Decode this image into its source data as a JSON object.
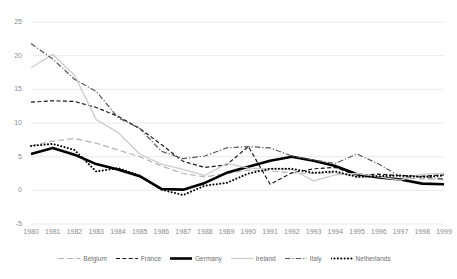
{
  "chart_data": {
    "type": "line",
    "title": "",
    "xlabel": "",
    "ylabel": "",
    "grid": true,
    "legend_position": "bottom",
    "xlim": [
      1980,
      1999
    ],
    "ylim": [
      -5,
      25
    ],
    "yticks": [
      -5,
      0,
      5,
      10,
      15,
      20,
      25
    ],
    "ytick_labels": [
      "-5",
      "0",
      "5",
      "10",
      "15",
      "20",
      "25"
    ],
    "x": [
      1980,
      1981,
      1982,
      1983,
      1984,
      1985,
      1986,
      1987,
      1988,
      1989,
      1990,
      1991,
      1992,
      1993,
      1994,
      1995,
      1996,
      1997,
      1998,
      1999
    ],
    "xtick_labels": [
      "1980",
      "1981",
      "1982",
      "1983",
      "1984",
      "1985",
      "1986",
      "1987",
      "1988",
      "1989",
      "1990",
      "1991",
      "1992",
      "1993",
      "1994",
      "1995",
      "1996",
      "1997",
      "1998",
      "1999"
    ],
    "series": [
      {
        "name": "Belgium",
        "color": "#b3b3b3",
        "style": "long-dash",
        "width": 1.2,
        "values": [
          6.6,
          7.3,
          7.7,
          7.0,
          6.0,
          5.0,
          3.6,
          2.5,
          2.0,
          2.5,
          3.0,
          2.9,
          2.6,
          2.5,
          2.6,
          2.0,
          2.0,
          1.8,
          1.7,
          1.6
        ]
      },
      {
        "name": "France",
        "color": "#1a1a1a",
        "style": "dash",
        "width": 1.2,
        "values": [
          13.1,
          13.3,
          13.2,
          12.3,
          11.0,
          9.2,
          6.8,
          4.3,
          3.4,
          3.8,
          6.5,
          0.9,
          2.6,
          3.2,
          3.4,
          2.2,
          2.4,
          2.2,
          2.1,
          2.3
        ]
      },
      {
        "name": "Germany",
        "color": "#000000",
        "style": "solid",
        "width": 2.6,
        "values": [
          5.4,
          6.3,
          5.3,
          3.9,
          3.1,
          2.1,
          0.2,
          0.1,
          1.1,
          2.6,
          3.5,
          4.4,
          5.0,
          4.4,
          3.6,
          2.4,
          1.9,
          1.6,
          1.0,
          0.9
        ]
      },
      {
        "name": "Ireland",
        "color": "#cccccc",
        "style": "solid",
        "width": 1.3,
        "values": [
          18.2,
          20.2,
          17.1,
          10.5,
          8.6,
          5.4,
          3.9,
          3.1,
          2.2,
          4.0,
          3.3,
          3.2,
          3.1,
          1.4,
          2.3,
          2.5,
          2.0,
          1.5,
          2.4,
          2.5
        ]
      },
      {
        "name": "Italy",
        "color": "#595959",
        "style": "dash-dot",
        "width": 1.2,
        "values": [
          21.8,
          19.5,
          16.5,
          14.7,
          10.8,
          9.2,
          5.8,
          4.7,
          5.1,
          6.3,
          6.5,
          6.3,
          5.1,
          4.5,
          4.0,
          5.4,
          3.9,
          2.0,
          2.0,
          1.7
        ]
      },
      {
        "name": "Netherlands",
        "color": "#000000",
        "style": "dot",
        "width": 2.0,
        "values": [
          6.6,
          6.9,
          6.0,
          2.8,
          3.3,
          2.2,
          0.1,
          -0.7,
          0.7,
          1.1,
          2.5,
          3.2,
          3.2,
          2.6,
          2.8,
          2.0,
          2.1,
          2.2,
          2.0,
          2.2
        ]
      }
    ]
  },
  "legend": {
    "items": [
      {
        "label": "Belgium"
      },
      {
        "label": "France"
      },
      {
        "label": "Germany"
      },
      {
        "label": "Ireland"
      },
      {
        "label": "Italy"
      },
      {
        "label": "Netherlands"
      }
    ]
  }
}
